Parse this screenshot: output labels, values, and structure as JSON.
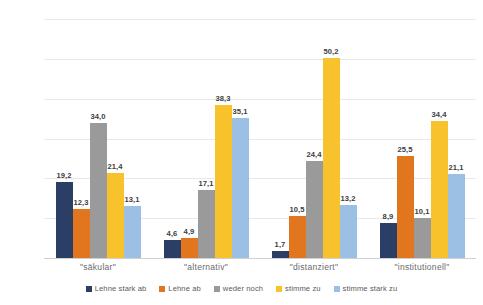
{
  "chart_data": {
    "type": "bar",
    "title": "",
    "subtitle": "",
    "xlabel": "",
    "ylabel": "Prozent",
    "ylim": [
      0,
      60
    ],
    "yticks": [
      0,
      10,
      20,
      30,
      40,
      50,
      60
    ],
    "ytick_labels": [
      "0",
      "10",
      "20",
      "30",
      "40",
      "50",
      "60"
    ],
    "grid": true,
    "legend_position": "bottom",
    "decimal_separator": ",",
    "categories": [
      "\"säkular\"",
      "\"alternativ\"",
      "\"distanziert\"",
      "\"institutionell\""
    ],
    "series": [
      {
        "name": "Lehne stark ab",
        "color": "#2B3F66",
        "values": [
          19.2,
          4.6,
          1.7,
          8.9
        ],
        "labels": [
          "19,2",
          "4,6",
          "1,7",
          "8,9"
        ]
      },
      {
        "name": "Lehne ab",
        "color": "#E2761F",
        "values": [
          12.3,
          4.9,
          10.5,
          25.5
        ],
        "labels": [
          "12,3",
          "4,9",
          "10,5",
          "25,5"
        ]
      },
      {
        "name": "weder noch",
        "color": "#9A9A9A",
        "values": [
          34.0,
          17.1,
          24.4,
          10.1
        ],
        "labels": [
          "34,0",
          "17,1",
          "24,4",
          "10,1"
        ]
      },
      {
        "name": "stimme zu",
        "color": "#F7C22B",
        "values": [
          21.4,
          38.3,
          50.2,
          34.4
        ],
        "labels": [
          "21,4",
          "38,3",
          "50,2",
          "34,4"
        ]
      },
      {
        "name": "stimme stark zu",
        "color": "#9CC0E3",
        "values": [
          13.1,
          35.1,
          13.2,
          21.1
        ],
        "labels": [
          "13,1",
          "35,1",
          "13,2",
          "21,1"
        ]
      }
    ]
  }
}
